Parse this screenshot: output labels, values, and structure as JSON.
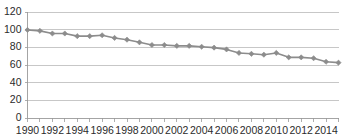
{
  "chart_data": {
    "type": "line",
    "title": "",
    "subtitle": "",
    "xlabel": "",
    "ylabel": "",
    "x": [
      1990,
      1991,
      1992,
      1993,
      1994,
      1995,
      1996,
      1997,
      1998,
      1999,
      2000,
      2001,
      2002,
      2003,
      2004,
      2005,
      2006,
      2007,
      2008,
      2009,
      2010,
      2011,
      2012,
      2013,
      2014,
      2015
    ],
    "values": [
      100,
      99,
      96,
      96,
      93,
      93,
      94,
      91,
      89,
      86,
      83,
      83,
      82,
      82,
      81,
      80,
      78,
      74,
      73,
      72,
      74,
      69,
      69,
      68,
      64,
      63
    ],
    "series": [
      {
        "name": "series-1",
        "values": [
          100,
          99,
          96,
          96,
          93,
          93,
          94,
          91,
          89,
          86,
          83,
          83,
          82,
          82,
          81,
          80,
          78,
          74,
          73,
          72,
          74,
          69,
          69,
          68,
          64,
          63
        ],
        "color": "#8c8c8c",
        "marker": "diamond"
      }
    ],
    "ylim": [
      0,
      120
    ],
    "yticks": [
      0,
      20,
      40,
      60,
      80,
      100,
      120
    ],
    "ytick_labels": [
      "0",
      "20",
      "40",
      "60",
      "80",
      "100",
      "120"
    ],
    "xlim": [
      1990,
      2015
    ],
    "xticks": [
      1990,
      1991,
      1992,
      1993,
      1994,
      1995,
      1996,
      1997,
      1998,
      1999,
      2000,
      2001,
      2002,
      2003,
      2004,
      2005,
      2006,
      2007,
      2008,
      2009,
      2010,
      2011,
      2012,
      2013,
      2014,
      2015
    ],
    "xtick_labels_shown": [
      "1990",
      "1992",
      "1994",
      "1996",
      "1998",
      "2000",
      "2002",
      "2004",
      "2006",
      "2008",
      "2010",
      "2012",
      "2014"
    ],
    "grid": {
      "horizontal": true,
      "vertical": false,
      "color": "#b9b9b9"
    },
    "legend": {
      "visible": false,
      "position": "none",
      "entries": []
    },
    "annotations": [],
    "colors": {
      "background": "#ffffff",
      "series": "#8c8c8c",
      "grid": "#b9b9b9",
      "axis": "#9a9a9a",
      "text": "#2b2b2b"
    }
  }
}
